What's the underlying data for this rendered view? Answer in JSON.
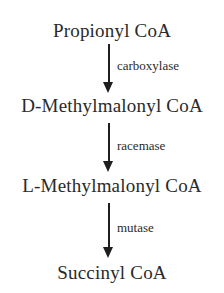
{
  "diagram": {
    "type": "metabolic-pathway",
    "direction": "top-to-bottom",
    "compounds": [
      {
        "label": "Propionyl CoA"
      },
      {
        "label": "D-Methylmalonyl CoA"
      },
      {
        "label": "L-Methylmalonyl CoA"
      },
      {
        "label": "Succinyl CoA"
      }
    ],
    "steps": [
      {
        "from": "Propionyl CoA",
        "to": "D-Methylmalonyl CoA",
        "enzyme": "carboxylase"
      },
      {
        "from": "D-Methylmalonyl CoA",
        "to": "L-Methylmalonyl CoA",
        "enzyme": "racemase"
      },
      {
        "from": "L-Methylmalonyl CoA",
        "to": "Succinyl CoA",
        "enzyme": "mutase"
      }
    ],
    "colors": {
      "text": "#2a2a2a",
      "arrow": "#1e1e1e",
      "background": "#ffffff"
    }
  }
}
